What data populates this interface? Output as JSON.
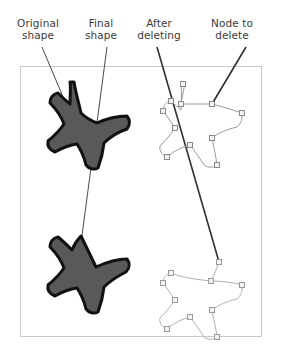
{
  "figure": {
    "background_color": "#ffffff",
    "frame": {
      "name": "canvas-frame",
      "x": 20,
      "y": 66,
      "width": 241,
      "height": 270,
      "stroke": "#c9c9c9",
      "stroke_width": 1,
      "fill": "#ffffff"
    },
    "labels": [
      {
        "id": "original-shape",
        "text": "Original\nshape",
        "color": "#3b3b3b",
        "font_size": 10.5
      },
      {
        "id": "final-shape",
        "text": "Final\nshape",
        "color": "#3b3b3b",
        "font_size": 10.5
      },
      {
        "id": "after-deleting",
        "text": "After\ndeleting",
        "color": "#3b3b3b",
        "font_size": 10.5
      },
      {
        "id": "node-to-delete",
        "text": "Node to\ndelete",
        "color": "#3b3b3b",
        "font_size": 10.5
      }
    ],
    "leader_lines": [
      {
        "id": "leader-original-shape",
        "x1": 42,
        "y1": 47,
        "x2": 66,
        "y2": 104,
        "stroke": "#4a4a4a",
        "stroke_width": 1
      },
      {
        "id": "leader-final-shape",
        "x1": 107,
        "y1": 47,
        "x2": 81,
        "y2": 243,
        "stroke": "#4a4a4a",
        "stroke_width": 1
      },
      {
        "id": "leader-after-deleting",
        "x1": 157,
        "y1": 47,
        "x2": 219,
        "y2": 262,
        "stroke": "#303030",
        "stroke_width": 1.6
      },
      {
        "id": "leader-node-to-delete",
        "x1": 246,
        "y1": 47,
        "x2": 212,
        "y2": 104,
        "stroke": "#303030",
        "stroke_width": 1.6
      }
    ],
    "shapes": [
      {
        "id": "original-star-filled",
        "style": "filled",
        "fill": "#595959",
        "stroke": "#111111",
        "stroke_width": 3,
        "position": "top-left",
        "description": "Original starfish with five curved arms, filled dark gray"
      },
      {
        "id": "final-star-filled",
        "style": "filled",
        "fill": "#595959",
        "stroke": "#111111",
        "stroke_width": 3,
        "position": "bottom-left",
        "description": "Final starfish after node deletion; upper-right arm collapsed into a straight angular wedge"
      },
      {
        "id": "original-star-outline",
        "style": "outline-with-nodes",
        "fill": "none",
        "stroke": "#9a9a9a",
        "stroke_width": 1,
        "node_fill": "#f2f2f2",
        "node_stroke": "#8a8a8a",
        "node_size": 5,
        "position": "top-right",
        "node_count": 10,
        "description": "Path view of the original star showing all editable nodes"
      },
      {
        "id": "edited-star-outline",
        "style": "outline-with-nodes",
        "fill": "none",
        "stroke": "#b0b0b0",
        "stroke_width": 1,
        "node_fill": "#f2f2f2",
        "node_stroke": "#9a9a9a",
        "node_size": 5,
        "position": "bottom-right",
        "node_count": 9,
        "description": "Path view after deleting one node; the top arm is now a straight segment"
      }
    ]
  }
}
